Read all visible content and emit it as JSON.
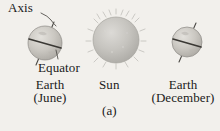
{
  "figure": {
    "caption": "(a)",
    "background_color": "#f2f0ec",
    "ink_color": "#1a1a1a",
    "labels": {
      "axis": "Axis",
      "equator": "Equator",
      "earth_june_line1": "Earth",
      "earth_june_line2": "(June)",
      "sun": "Sun",
      "earth_december_line1": "Earth",
      "earth_december_line2": "(December)"
    },
    "bodies": [
      {
        "name": "earth-june",
        "kind": "earth",
        "cx": 45,
        "cy": 43,
        "r": 17,
        "fill": "#c9c6c0",
        "axis_tilt_deg": 23,
        "has_equator_line": true,
        "season": "June"
      },
      {
        "name": "sun",
        "kind": "sun",
        "cx": 116,
        "cy": 40,
        "r": 23,
        "fill": "#c4c2bd",
        "has_corona_spikes": true
      },
      {
        "name": "earth-december",
        "kind": "earth",
        "cx": 187,
        "cy": 42,
        "r": 15,
        "fill": "#c9c6c0",
        "axis_tilt_deg": 23,
        "has_equator_line": true,
        "season": "December"
      }
    ],
    "leader_lines": [
      {
        "name": "axis-leader",
        "from": [
          42,
          13
        ],
        "to": [
          57,
          27
        ]
      },
      {
        "name": "equator-leader",
        "from": [
          58,
          59
        ],
        "to": [
          56,
          50
        ]
      }
    ]
  }
}
